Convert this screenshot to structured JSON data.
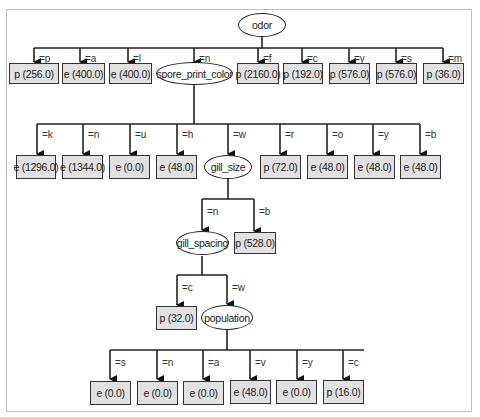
{
  "diagram": {
    "type": "decision_tree",
    "root": {
      "attribute": "odor",
      "children": [
        {
          "edge": "=p",
          "leaf": "p (256.0)"
        },
        {
          "edge": "=a",
          "leaf": "e (400.0)"
        },
        {
          "edge": "=l",
          "leaf": "e (400.0)"
        },
        {
          "edge": "=n",
          "attribute": "spore_print_color"
        },
        {
          "edge": "=f",
          "leaf": "p (2160.0)"
        },
        {
          "edge": "=c",
          "leaf": "p (192.0)"
        },
        {
          "edge": "=y",
          "leaf": "p (576.0)"
        },
        {
          "edge": "=s",
          "leaf": "p (576.0)"
        },
        {
          "edge": "=m",
          "leaf": "p (36.0)"
        }
      ]
    },
    "spore_print_color": {
      "attribute": "spore_print_color",
      "children": [
        {
          "edge": "=k",
          "leaf": "e (1296.0)"
        },
        {
          "edge": "=n",
          "leaf": "e (1344.0)"
        },
        {
          "edge": "=u",
          "leaf": "e (0.0)"
        },
        {
          "edge": "=h",
          "leaf": "e (48.0)"
        },
        {
          "edge": "=w",
          "attribute": "gill_size"
        },
        {
          "edge": "=r",
          "leaf": "p (72.0)"
        },
        {
          "edge": "=o",
          "leaf": "e (48.0)"
        },
        {
          "edge": "=y",
          "leaf": "e (48.0)"
        },
        {
          "edge": "=b",
          "leaf": "e (48.0)"
        }
      ]
    },
    "gill_size": {
      "attribute": "gill_size",
      "children": [
        {
          "edge": "=n",
          "attribute": "gill_spacing"
        },
        {
          "edge": "=b",
          "leaf": "p (528.0)"
        }
      ]
    },
    "gill_spacing": {
      "attribute": "gill_spacing",
      "children": [
        {
          "edge": "=c",
          "leaf": "p (32.0)"
        },
        {
          "edge": "=w",
          "attribute": "population"
        }
      ]
    },
    "population": {
      "attribute": "population",
      "children": [
        {
          "edge": "=s",
          "leaf": "e (0.0)"
        },
        {
          "edge": "=n",
          "leaf": "e (0.0)"
        },
        {
          "edge": "=a",
          "leaf": "e (0.0)"
        },
        {
          "edge": "=v",
          "leaf": "e (48.0)"
        },
        {
          "edge": "=y",
          "leaf": "e (0.0)"
        },
        {
          "edge": "=c",
          "leaf": "p (16.0)"
        }
      ]
    }
  },
  "colors": {
    "leaf_fill": "#e1e1e1",
    "split_fill": "#ffffff",
    "stroke": "#222222",
    "frame": "#bdbdbd"
  }
}
